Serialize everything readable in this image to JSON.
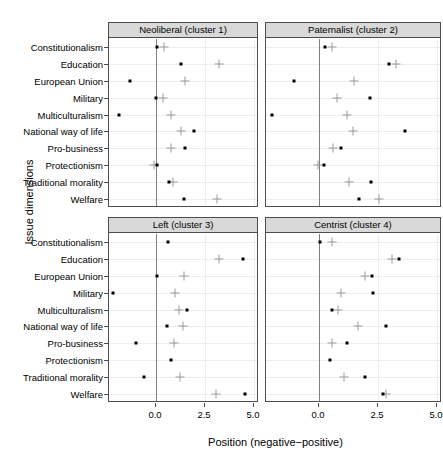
{
  "chart_data": {
    "type": "scatter",
    "title": "",
    "xlabel": "Position (negative−positive)",
    "ylabel": "Issue dimensions",
    "xlim": [
      -2.2,
      5.35
    ],
    "xticks": [
      0.0,
      2.5,
      5.0
    ],
    "xticklabels": [
      "0.0",
      "2.5",
      "5.0"
    ],
    "grid": true,
    "legend": "none",
    "marker_series": [
      {
        "name": "point",
        "symbol": "filled-square",
        "color": "#000000"
      },
      {
        "name": "plus",
        "symbol": "plus",
        "color": "#9a9a9a"
      }
    ],
    "categories": [
      "Constitutionalism",
      "Education",
      "European Union",
      "Military",
      "Multiculturalism",
      "National way of life",
      "Pro-business",
      "Protectionism",
      "Traditional morality",
      "Welfare"
    ],
    "panels": [
      {
        "id": "cluster1",
        "label": "Neoliberal (cluster 1)",
        "row": 0,
        "col": 0,
        "point": [
          0.05,
          1.25,
          -1.35,
          0.0,
          -1.9,
          1.95,
          1.5,
          0.05,
          0.65,
          1.45
        ],
        "plus": [
          0.4,
          3.2,
          1.5,
          0.35,
          0.75,
          1.25,
          0.75,
          -0.1,
          0.85,
          3.1
        ]
      },
      {
        "id": "cluster2",
        "label": "Paternalist (cluster 2)",
        "row": 0,
        "col": 1,
        "point": [
          0.25,
          2.95,
          -1.05,
          2.15,
          -2.0,
          3.65,
          0.95,
          0.2,
          2.2,
          1.7
        ],
        "plus": [
          0.55,
          3.25,
          1.5,
          0.75,
          1.2,
          1.45,
          0.6,
          -0.05,
          1.25,
          2.55
        ]
      },
      {
        "id": "cluster3",
        "label": "Left (cluster 3)",
        "row": 1,
        "col": 0,
        "point": [
          0.6,
          4.45,
          0.05,
          -2.2,
          1.6,
          0.55,
          -1.0,
          0.75,
          -0.6,
          4.55
        ],
        "plus": [
          null,
          3.2,
          1.45,
          0.95,
          1.15,
          1.4,
          0.9,
          null,
          1.2,
          3.05
        ]
      },
      {
        "id": "cluster4",
        "label": "Centrist (cluster 4)",
        "row": 1,
        "col": 1,
        "point": [
          0.05,
          3.4,
          2.25,
          2.3,
          0.55,
          2.85,
          1.2,
          0.45,
          1.95,
          2.7
        ],
        "plus": [
          0.55,
          3.1,
          1.95,
          0.95,
          0.8,
          1.65,
          0.55,
          null,
          1.05,
          2.85
        ]
      }
    ]
  },
  "axis": {
    "x_title": "Position (negative−positive)",
    "y_title": "Issue dimensions"
  },
  "colors": {
    "point": "#000000",
    "plus": "#9a9a9a",
    "panel_border": "#4d4d4d",
    "strip_bg": "#d9d9d9",
    "grid": "#ededed",
    "zero_line": "#808080",
    "background": "#ffffff"
  }
}
